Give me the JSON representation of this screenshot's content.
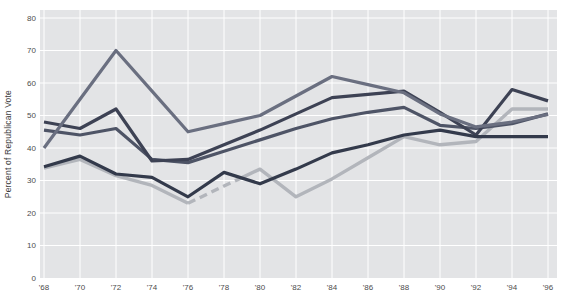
{
  "chart_data": {
    "type": "line",
    "title": "",
    "xlabel": "",
    "ylabel": "Percent of Republican Vote",
    "ylim": [
      0,
      80
    ],
    "y_ticks": [
      0,
      10,
      20,
      30,
      40,
      50,
      60,
      70,
      80
    ],
    "years": [
      1968,
      1970,
      1972,
      1974,
      1976,
      1978,
      1980,
      1982,
      1984,
      1986,
      1988,
      1990,
      1992,
      1994,
      1996
    ],
    "x_tick_labels": [
      "'68",
      "'70",
      "'72",
      "'74",
      "'76",
      "'78",
      "'80",
      "'82",
      "'84",
      "'86",
      "'88",
      "'90",
      "'92",
      "'94",
      "'96"
    ],
    "grid": true,
    "legend": "none",
    "plot_bg_color": "#e3e4e6",
    "grid_color": "#ffffff",
    "tick_label_color": "#4c4c4c",
    "axis_title_color": "#3c3c3c",
    "series": [
      {
        "name": "gray-line-dashed-mid70s",
        "color": "#b2b5bb",
        "stroke_width": 3.4,
        "values": [
          33.8,
          36.5,
          31.5,
          28.5,
          23,
          28.3,
          33.5,
          25,
          30.5,
          37,
          43.5,
          41,
          42,
          52,
          52
        ],
        "dashed_between": [
          1976,
          1979
        ]
      },
      {
        "name": "slate-line-c",
        "color": "#4e5466",
        "stroke_width": 3.2,
        "values": [
          45.5,
          44,
          46,
          36.5,
          35.5,
          39,
          42.5,
          46,
          49,
          51,
          52.5,
          47,
          46,
          47.5,
          50.5
        ]
      },
      {
        "name": "dark-line-b-peak-94",
        "color": "#3d4254",
        "stroke_width": 3.2,
        "values": [
          48,
          46,
          52,
          36,
          36.5,
          41,
          45.5,
          50.5,
          55.5,
          56.5,
          57.5,
          51,
          44,
          58,
          54.5
        ]
      },
      {
        "name": "medium-slate-line-a-peak-72",
        "color": "#6a6f80",
        "stroke_width": 3.2,
        "values": [
          40,
          55,
          70,
          57.5,
          45,
          47.5,
          50,
          56,
          62,
          59.5,
          57,
          50.5,
          46.5,
          48,
          50.3
        ]
      },
      {
        "name": "darkest-navy-line-d",
        "color": "#333a4b",
        "stroke_width": 3.2,
        "values": [
          34.2,
          37.5,
          32,
          31,
          25,
          32.5,
          29,
          33.5,
          38.5,
          41,
          44,
          45.5,
          43.5,
          43.5,
          43.5
        ]
      }
    ]
  }
}
